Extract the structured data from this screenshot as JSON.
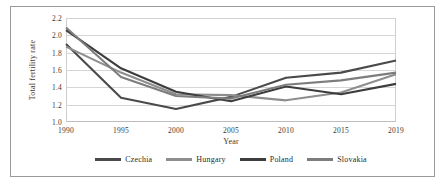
{
  "chart_data": {
    "type": "line",
    "title": "",
    "xlabel": "Year",
    "ylabel": "Total fertility rate",
    "categories": [
      "1990",
      "1995",
      "2000",
      "2005",
      "2010",
      "2015",
      "2019"
    ],
    "x": [
      1990,
      1995,
      2000,
      2005,
      2010,
      2015,
      2019
    ],
    "ylim": [
      1.0,
      2.2
    ],
    "yticks": [
      "2.2",
      "2.0",
      "1.8",
      "1.6",
      "1.4",
      "1.2",
      "1.0"
    ],
    "ytick_values": [
      2.2,
      2.0,
      1.8,
      1.6,
      1.4,
      1.2,
      1.0
    ],
    "grid": "horizontal",
    "legend_position": "bottom",
    "series": [
      {
        "name": "Czechia",
        "color": "#4a4a4a",
        "values": [
          1.9,
          1.28,
          1.15,
          1.29,
          1.51,
          1.57,
          1.71
        ]
      },
      {
        "name": "Hungary",
        "color": "#8e8e8e",
        "values": [
          1.87,
          1.57,
          1.32,
          1.31,
          1.25,
          1.34,
          1.55
        ]
      },
      {
        "name": "Poland",
        "color": "#3d3d3d",
        "values": [
          2.06,
          1.62,
          1.35,
          1.24,
          1.41,
          1.32,
          1.44
        ]
      },
      {
        "name": "Slovakia",
        "color": "#7d7d7d",
        "values": [
          2.09,
          1.52,
          1.3,
          1.27,
          1.43,
          1.48,
          1.57
        ]
      }
    ]
  }
}
